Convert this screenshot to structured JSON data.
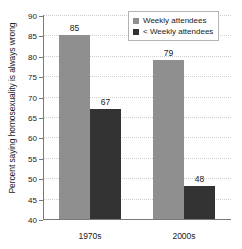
{
  "chart_data": {
    "type": "bar",
    "title": "",
    "subtitle": "",
    "xlabel": "",
    "ylabel": "Percent saying homosexuality is always wrong",
    "categories": [
      "1970s",
      "2000s"
    ],
    "series": [
      {
        "name": "Weekly attendees",
        "values": [
          85,
          79
        ],
        "color": "#8f8f8f"
      },
      {
        "name": "< Weekly attendees",
        "values": [
          67,
          48
        ],
        "color": "#333333"
      }
    ],
    "ylim": [
      40,
      90
    ],
    "ytick_step": 5,
    "ytick_labels": [
      "40",
      "45",
      "50",
      "55",
      "60",
      "65",
      "70",
      "75",
      "80",
      "85",
      "90"
    ],
    "grid": true,
    "grid_orientation": "horizontal",
    "grid_style": "dotted",
    "legend_position": "top-right",
    "data_labels": true,
    "axis_color": "#7a7a7a",
    "background": "#ffffff"
  },
  "legend": {
    "items": [
      {
        "label": "Weekly attendees"
      },
      {
        "label": "< Weekly attendees"
      }
    ]
  },
  "axes": {
    "y_title": "Percent saying homosexuality is always wrong",
    "x_labels": [
      "1970s",
      "2000s"
    ]
  },
  "bar_labels": {
    "g0s0": "85",
    "g0s1": "67",
    "g1s0": "79",
    "g1s1": "48"
  }
}
